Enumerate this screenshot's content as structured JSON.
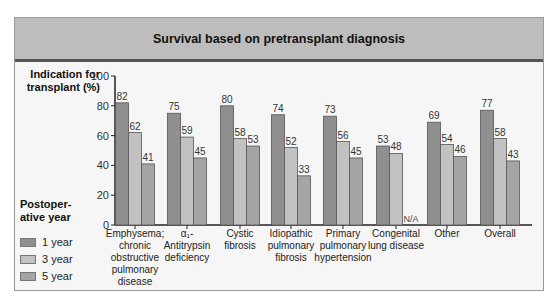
{
  "title": "Survival based on pretransplant diagnosis",
  "y_axis_label": "Indication for transplant (%)",
  "legend": {
    "title": "Postoperative year",
    "title_display": "Postoper-\native year",
    "items": [
      {
        "label": "1 year",
        "color": "#8f8f8f"
      },
      {
        "label": "3 year",
        "color": "#c2c2c2"
      },
      {
        "label": "5 year",
        "color": "#a4a4a4"
      }
    ]
  },
  "chart_data": {
    "type": "bar",
    "title": "Survival based on pretransplant diagnosis",
    "xlabel": "",
    "ylabel": "Indication for transplant (%)",
    "ylim": [
      0,
      100
    ],
    "yticks": [
      0,
      20,
      40,
      60,
      80,
      100
    ],
    "grid": false,
    "legend_position": "left",
    "categories": [
      "Emphysema; chronic obstructive pulmonary disease",
      "α1-Antitrypsin deficiency",
      "Cystic fibrosis",
      "Idiopathic pulmonary fibrosis",
      "Primary pulmonary hypertension",
      "Congenital lung disease",
      "Other",
      "Overall"
    ],
    "category_display": [
      [
        "Emphysema;",
        "chronic",
        "obstructive",
        "pulmonary",
        "disease"
      ],
      [
        "α₁-",
        "Antitrypsin",
        "deficiency"
      ],
      [
        "Cystic",
        "fibrosis"
      ],
      [
        "Idiopathic",
        "pulmonary",
        "fibrosis"
      ],
      [
        "Primary",
        "pulmonary",
        "hypertension"
      ],
      [
        "Congenital",
        "lung disease"
      ],
      [
        "Other"
      ],
      [
        "Overall"
      ]
    ],
    "series": [
      {
        "name": "1 year",
        "values": [
          82,
          75,
          80,
          74,
          73,
          53,
          69,
          77
        ]
      },
      {
        "name": "3 year",
        "values": [
          62,
          59,
          58,
          52,
          56,
          48,
          54,
          58
        ]
      },
      {
        "name": "5 year",
        "values": [
          41,
          45,
          53,
          33,
          45,
          null,
          46,
          43
        ]
      }
    ],
    "annotations": [
      {
        "category": "Congenital lung disease",
        "series": "5 year",
        "text": "N/A"
      }
    ]
  }
}
